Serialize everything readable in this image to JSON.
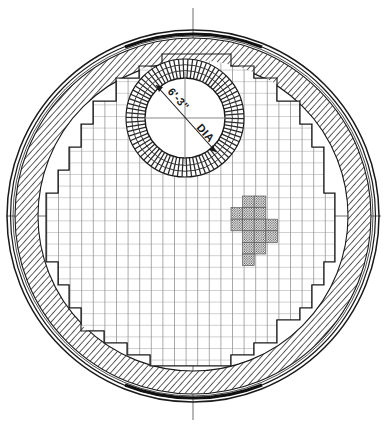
{
  "drawing": {
    "title": "Circular Furnace Checkerwork Plan Section",
    "type": "engineering-plan-section",
    "background_color": "#ffffff",
    "ink_color": "#1a1a1a",
    "hatch_color": "#2a2a2a",
    "grid_color": "#555555",
    "grid_color_light": "#8d8d8d",
    "stipple_color": "#4a4a4a"
  },
  "annotations": {
    "center_opening_dimension": "6'-3\"",
    "center_opening_unit_label": "DIA",
    "center_opening_full": "6'-3\" DIA"
  },
  "geometry": {
    "canvas_width": 387,
    "canvas_height": 425,
    "center_x": 193,
    "center_y": 216,
    "outer_shell_radius": 186,
    "shell_inner_radius": 181,
    "lining_outer_radius": 178,
    "lining_inner_radius": 155,
    "opening_center_x": 185,
    "opening_center_y": 118,
    "opening_radius": 40,
    "opening_hatch_outer_radius": 59,
    "grid_cell": 11.6
  },
  "elements": {
    "outer_shell": "outer-steel-shell",
    "refractory_ring": "hatched-refractory-lining",
    "checkerwork": "stepped-brick-grid",
    "center_opening": "central-circular-opening",
    "stipple_marker": "cross-shaped-stipple-marker",
    "vertical_centerline": "vertical-center-line",
    "horizontal_centerline": "horizontal-center-line"
  },
  "chart_data": {
    "type": "table",
    "categories": [
      "outer shell",
      "refractory lining ring",
      "checkerwork grid",
      "central opening",
      "stipple marker"
    ],
    "values": [
      186,
      178,
      155,
      40,
      1
    ],
    "xlabel": "element",
    "ylabel": "radius (px)"
  }
}
